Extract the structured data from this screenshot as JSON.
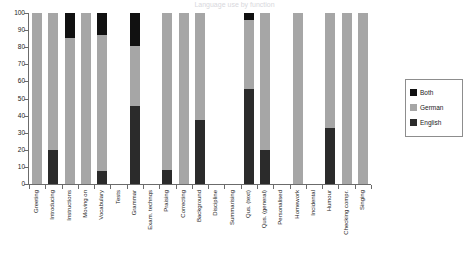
{
  "chart_data": {
    "type": "bar",
    "stacked": true,
    "title": "Language use by function",
    "xlabel": "",
    "ylabel": "",
    "ylim": [
      0,
      100
    ],
    "yticks": [
      0,
      10,
      20,
      30,
      40,
      50,
      60,
      70,
      80,
      90,
      100
    ],
    "grid": false,
    "legend_position": "right",
    "colors": {
      "Both": "#111111",
      "German": "#a6a6a6",
      "English": "#2b2b2b"
    },
    "categories": [
      "Greeting",
      "Introducing",
      "Instructions",
      "Moving on",
      "Vocabulary",
      "Tests",
      "Grammar",
      "Exam. technqs",
      "Praising",
      "Correcting",
      "Background",
      "Discipline",
      "Summarising",
      "Qus. (text)",
      "Qus. (general)",
      "Personalised",
      "Homework",
      "Incidental",
      "Humour",
      "Checking compr.",
      "Singing"
    ],
    "series": [
      {
        "name": "English",
        "values": [
          0,
          20,
          0,
          0,
          7.5,
          0,
          45.5,
          0,
          8,
          0,
          37.5,
          0,
          0,
          55.5,
          20,
          0,
          0,
          0,
          33,
          0,
          0
        ]
      },
      {
        "name": "German",
        "values": [
          100,
          80,
          85.5,
          100,
          79.5,
          0,
          35.5,
          0,
          92,
          100,
          62.5,
          0,
          0,
          40.5,
          80,
          0,
          100,
          0,
          67,
          100,
          100
        ]
      },
      {
        "name": "Both",
        "values": [
          0,
          0,
          14.5,
          0,
          13,
          0,
          19,
          0,
          0,
          0,
          0,
          0,
          0,
          4,
          0,
          0,
          0,
          0,
          0,
          0,
          0
        ]
      }
    ]
  },
  "legend": {
    "entries": [
      {
        "label": "Both",
        "color": "#111111"
      },
      {
        "label": "German",
        "color": "#a6a6a6"
      },
      {
        "label": "English",
        "color": "#2b2b2b"
      }
    ]
  }
}
